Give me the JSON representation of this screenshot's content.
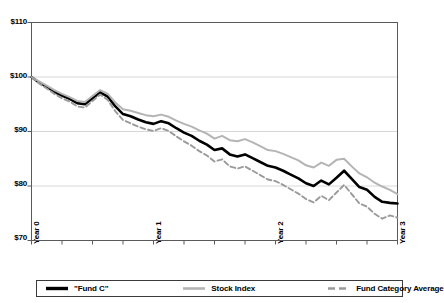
{
  "chart_data": {
    "type": "line",
    "title": "",
    "xlabel": "",
    "ylabel": "",
    "ylim": [
      70,
      110
    ],
    "xlim": [
      0,
      3
    ],
    "grid": true,
    "gridlines_y": [
      80,
      90,
      100
    ],
    "legend_position": "bottom",
    "y_tick_labels": [
      "$110",
      "$100",
      "$90",
      "$80",
      "$70"
    ],
    "y_tick_values": [
      110,
      100,
      90,
      80,
      70
    ],
    "x_tick_labels": [
      "Year 0",
      "Year 1",
      "Year 2",
      "Year 3"
    ],
    "x_tick_values": [
      0,
      1,
      2,
      3
    ],
    "x": [
      0,
      0.0625,
      0.125,
      0.1875,
      0.25,
      0.3125,
      0.375,
      0.4375,
      0.5,
      0.5625,
      0.625,
      0.6875,
      0.75,
      0.8125,
      0.875,
      0.9375,
      1.0,
      1.0625,
      1.125,
      1.1875,
      1.25,
      1.3125,
      1.375,
      1.4375,
      1.5,
      1.5625,
      1.625,
      1.6875,
      1.75,
      1.8125,
      1.875,
      1.9375,
      2.0,
      2.0625,
      2.125,
      2.1875,
      2.25,
      2.3125,
      2.375,
      2.4375,
      2.5,
      2.5625,
      2.625,
      2.6875,
      2.75,
      2.8125,
      2.875,
      2.9375,
      3.0
    ],
    "series": [
      {
        "name": "\"Fund C\"",
        "color": "#000000",
        "style": "solid",
        "width": 2.6,
        "values": [
          100.0,
          99.0,
          98.2,
          97.3,
          96.6,
          96.0,
          95.2,
          95.0,
          96.1,
          97.2,
          96.4,
          94.6,
          93.2,
          92.8,
          92.2,
          91.7,
          91.4,
          91.9,
          91.5,
          90.6,
          89.8,
          89.2,
          88.3,
          87.6,
          86.6,
          86.9,
          85.8,
          85.4,
          85.8,
          85.1,
          84.4,
          83.7,
          83.4,
          82.8,
          82.1,
          81.4,
          80.5,
          80.0,
          81.0,
          80.3,
          81.5,
          82.8,
          81.3,
          79.8,
          79.3,
          78.0,
          77.1,
          76.9,
          76.8
        ]
      },
      {
        "name": "Stock Index",
        "color": "#b4b4b4",
        "style": "solid",
        "width": 2.0,
        "values": [
          100.0,
          99.2,
          98.4,
          97.6,
          96.9,
          96.3,
          95.6,
          95.4,
          96.5,
          97.6,
          96.9,
          95.3,
          94.1,
          93.8,
          93.4,
          93.0,
          92.8,
          93.1,
          92.7,
          92.0,
          91.4,
          90.9,
          90.2,
          89.6,
          88.7,
          89.2,
          88.4,
          88.2,
          88.6,
          88.0,
          87.3,
          86.6,
          86.4,
          85.9,
          85.3,
          84.7,
          83.8,
          83.4,
          84.3,
          83.7,
          84.8,
          85.0,
          83.6,
          82.3,
          81.6,
          80.6,
          79.9,
          79.3,
          78.5
        ]
      },
      {
        "name": "Fund Category Average",
        "color": "#9a9a9a",
        "style": "dashed",
        "width": 1.9,
        "values": [
          100.0,
          98.8,
          97.9,
          96.9,
          96.1,
          95.5,
          94.6,
          94.4,
          95.6,
          96.8,
          95.8,
          93.7,
          92.1,
          91.5,
          90.9,
          90.4,
          90.1,
          90.6,
          90.1,
          89.1,
          88.2,
          87.4,
          86.4,
          85.6,
          84.5,
          84.9,
          83.6,
          83.2,
          83.6,
          82.8,
          82.0,
          81.2,
          80.9,
          80.2,
          79.4,
          78.6,
          77.6,
          77.0,
          78.2,
          77.4,
          78.8,
          80.2,
          78.5,
          76.8,
          76.2,
          74.9,
          74.0,
          74.6,
          74.2
        ]
      }
    ]
  },
  "axes": {
    "y_labels": [
      "$110",
      "$100",
      "$90",
      "$80",
      "$70"
    ],
    "x_labels": [
      "Year 0",
      "Year 1",
      "Year 2",
      "Year 3"
    ]
  },
  "legend": {
    "entries": [
      {
        "label": "\"Fund C\"",
        "icon": "line-swatch-solid-black"
      },
      {
        "label": "Stock Index",
        "icon": "line-swatch-solid-gray"
      },
      {
        "label": "Fund Category Average",
        "icon": "line-swatch-dashed-gray"
      }
    ]
  }
}
